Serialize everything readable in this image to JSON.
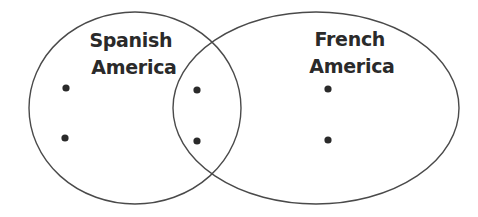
{
  "diagram": {
    "type": "venn",
    "sets": [
      {
        "id": "spanish-america",
        "label_lines": [
          "Spanish",
          "America"
        ],
        "ellipse": {
          "cx": 135,
          "cy": 108,
          "rx": 106,
          "ry": 96
        },
        "label_x": 134,
        "bullets": [
          {
            "x": 66,
            "y": 88,
            "text": ""
          },
          {
            "x": 65,
            "y": 138,
            "text": ""
          }
        ]
      },
      {
        "id": "french-america",
        "label_lines": [
          "French",
          "America"
        ],
        "ellipse": {
          "cx": 316,
          "cy": 108,
          "rx": 143,
          "ry": 96
        },
        "label_x": 352,
        "bullets": [
          {
            "x": 328,
            "y": 89,
            "text": ""
          },
          {
            "x": 328,
            "y": 140,
            "text": ""
          }
        ]
      }
    ],
    "overlap": {
      "label": "",
      "bullets": [
        {
          "x": 197,
          "y": 90,
          "text": ""
        },
        {
          "x": 197,
          "y": 141,
          "text": ""
        }
      ]
    },
    "colors": {
      "stroke": "#4a4a4a",
      "text": "#2a2a2a",
      "background": "#ffffff"
    }
  }
}
